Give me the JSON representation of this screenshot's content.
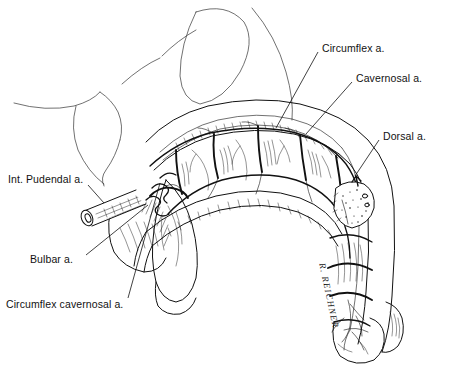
{
  "figure": {
    "type": "anatomical line drawing",
    "background_color": "#ffffff",
    "ink_color": "#111111"
  },
  "labels": [
    {
      "id": "circumflex",
      "text": "Circumflex a.",
      "x": 322,
      "y": 47,
      "anchor": "left"
    },
    {
      "id": "cavernosal",
      "text": "Cavernosal a.",
      "x": 356,
      "y": 77,
      "anchor": "left"
    },
    {
      "id": "dorsal",
      "text": "Dorsal a.",
      "x": 383,
      "y": 135,
      "anchor": "left"
    },
    {
      "id": "int-pudendal",
      "text": "Int. Pudendal a.",
      "x": 8,
      "y": 178,
      "anchor": "left"
    },
    {
      "id": "bulbar",
      "text": "Bulbar a.",
      "x": 30,
      "y": 258,
      "anchor": "left"
    },
    {
      "id": "circumflex-cavernosal",
      "text": "Circumflex cavernosal a.",
      "x": 6,
      "y": 303,
      "anchor": "left"
    }
  ],
  "signature": {
    "text": "R. REICHNER",
    "x": 327,
    "y": 262,
    "rotation_deg": 78
  },
  "leaders": [
    {
      "id": "leader-circumflex",
      "from": [
        318,
        52
      ],
      "to": [
        276,
        128
      ]
    },
    {
      "id": "leader-cavernosal",
      "from": [
        352,
        82
      ],
      "to": [
        306,
        134
      ]
    },
    {
      "id": "leader-dorsal",
      "from": [
        379,
        140
      ],
      "to": [
        355,
        176
      ]
    },
    {
      "id": "leader-int-pudendal",
      "from": [
        88,
        185
      ],
      "to": [
        104,
        203
      ]
    },
    {
      "id": "leader-bulbar",
      "from": [
        86,
        255
      ],
      "to": [
        148,
        205
      ]
    },
    {
      "id": "leader-circumflex-cavernosal",
      "from": [
        128,
        298
      ],
      "to": [
        160,
        183
      ]
    }
  ],
  "structures": [
    {
      "id": "pubic-symphysis",
      "name": "Pubic symphysis outline"
    },
    {
      "id": "bladder-oval",
      "name": "Elongated oval body outline"
    },
    {
      "id": "corpus-cavernosum",
      "name": "Segmented corpus cavernosum"
    },
    {
      "id": "corpus-spongiosum",
      "name": "Corpus spongiosum / urethra"
    },
    {
      "id": "crus-bulb",
      "name": "Crus and bulb of penis"
    },
    {
      "id": "dorsal-band",
      "name": "Dorsal neurovascular band"
    },
    {
      "id": "cut-stump",
      "name": "Cut internal pudendal artery stump"
    },
    {
      "id": "cut-window",
      "name": "Cut window showing cavernosal artery"
    },
    {
      "id": "glans",
      "name": "Glans penis"
    }
  ]
}
